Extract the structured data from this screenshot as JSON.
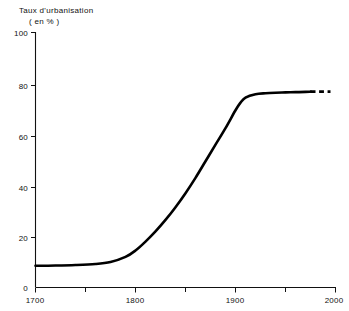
{
  "chart_data": {
    "type": "line",
    "title": "Taux d'urbanisation",
    "subtitle": "( en % )",
    "xlabel": "",
    "ylabel": "",
    "xlim": [
      1700,
      2000
    ],
    "ylim": [
      0,
      100
    ],
    "grid": false,
    "legend": null,
    "x_ticks": [
      1700,
      1800,
      1900,
      2000
    ],
    "x_tick_labels": [
      "1700",
      "1800",
      "1900",
      "2000"
    ],
    "x_minor_ticks": [
      1750,
      1850,
      1950
    ],
    "y_ticks": [
      0,
      20,
      40,
      60,
      80,
      100
    ],
    "y_tick_labels": [
      "0",
      "20",
      "40",
      "60",
      "80",
      "100"
    ],
    "series": [
      {
        "name": "Taux d'urbanisation",
        "style": "solid",
        "x": [
          1700,
          1720,
          1740,
          1760,
          1775,
          1790,
          1800,
          1810,
          1820,
          1830,
          1840,
          1850,
          1860,
          1870,
          1880,
          1890,
          1900,
          1905,
          1910,
          1920,
          1930,
          1940,
          1950,
          1960,
          1970,
          1975
        ],
        "values": [
          8.5,
          8.6,
          8.8,
          9.2,
          10.0,
          12.0,
          14.5,
          18.0,
          22.0,
          26.5,
          31.5,
          37.0,
          43.0,
          49.5,
          56.0,
          62.5,
          69.5,
          72.5,
          74.5,
          75.8,
          76.2,
          76.4,
          76.5,
          76.6,
          76.7,
          76.8
        ]
      },
      {
        "name": "Projection",
        "style": "dashed",
        "x": [
          1975,
          1985,
          1995
        ],
        "values": [
          76.8,
          76.8,
          76.8
        ]
      }
    ],
    "annotations": [
      {
        "text": "courbe en S (logistique), plateau vers 77 %"
      }
    ]
  }
}
